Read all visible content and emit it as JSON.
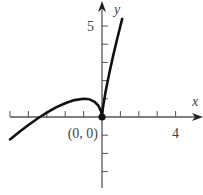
{
  "chart_data": {
    "type": "line",
    "title": "",
    "function": "y = 2x + 3x^(2/3)",
    "xlabel": "x",
    "ylabel": "y",
    "xlim": [
      -5.1,
      5.5
    ],
    "ylim": [
      -3.9,
      6.3
    ],
    "x_ticks": [
      -5,
      -4,
      -3,
      -2,
      -1,
      1,
      2,
      3,
      4
    ],
    "y_ticks": [
      -3,
      -2,
      -1,
      1,
      2,
      3,
      4,
      5
    ],
    "x_tick_labels": [
      {
        "value": 4,
        "text": "4"
      }
    ],
    "y_tick_labels": [
      {
        "value": 5,
        "text": "5"
      }
    ],
    "series": [
      {
        "name": "f(x)",
        "x": [
          -5,
          -4.5,
          -4,
          -3.5,
          -3.375,
          -3,
          -2.5,
          -2,
          -1.5,
          -1,
          -0.7,
          -0.4,
          -0.2,
          -0.05,
          0,
          0.05,
          0.2,
          0.4,
          0.6,
          0.8,
          1.0,
          1.1
        ],
        "y": [
          -1.23,
          -0.82,
          -0.44,
          -0.08,
          0.0,
          0.24,
          0.53,
          0.76,
          0.93,
          1.0,
          0.98,
          0.83,
          0.63,
          0.31,
          0,
          0.51,
          1.43,
          2.43,
          3.33,
          4.19,
          5.0,
          5.39
        ]
      }
    ],
    "annotations": [
      {
        "text": "(0, 0)",
        "x": 0,
        "y": 0,
        "marker": "filled-dot"
      }
    ],
    "grid": false,
    "colors": {
      "curve": "#111111",
      "axis": "#555555",
      "text": "#444444"
    }
  }
}
